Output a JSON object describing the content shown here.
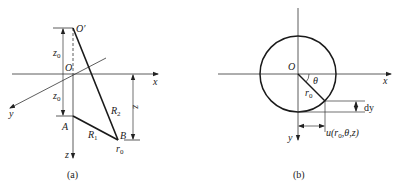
{
  "panel_a": {
    "caption": "(a)",
    "labels": {
      "o_prime": "O′",
      "o": "O",
      "x_axis": "x",
      "y_axis": "y",
      "z_axis": "z",
      "z0_upper": "z",
      "z0_upper_sub": "0",
      "z0_lower": "z",
      "z0_lower_sub": "0",
      "point_a": "A",
      "point_b": "B",
      "r1": "R",
      "r1_sub": "1",
      "r2": "R",
      "r2_sub": "2",
      "z_dim": "z",
      "r0": "r",
      "r0_sub": "0"
    }
  },
  "panel_b": {
    "caption": "(b)",
    "labels": {
      "o": "O",
      "x_axis": "x",
      "y_axis": "y",
      "theta": "θ",
      "r0": "r",
      "r0_sub": "0",
      "dy": "dy",
      "u_func": "u(r",
      "u_sub": "0",
      "u_rest": ",θ,z)"
    }
  },
  "colors": {
    "line": "#222222",
    "thick_line": "#1a1a1a",
    "background": "#ffffff"
  }
}
